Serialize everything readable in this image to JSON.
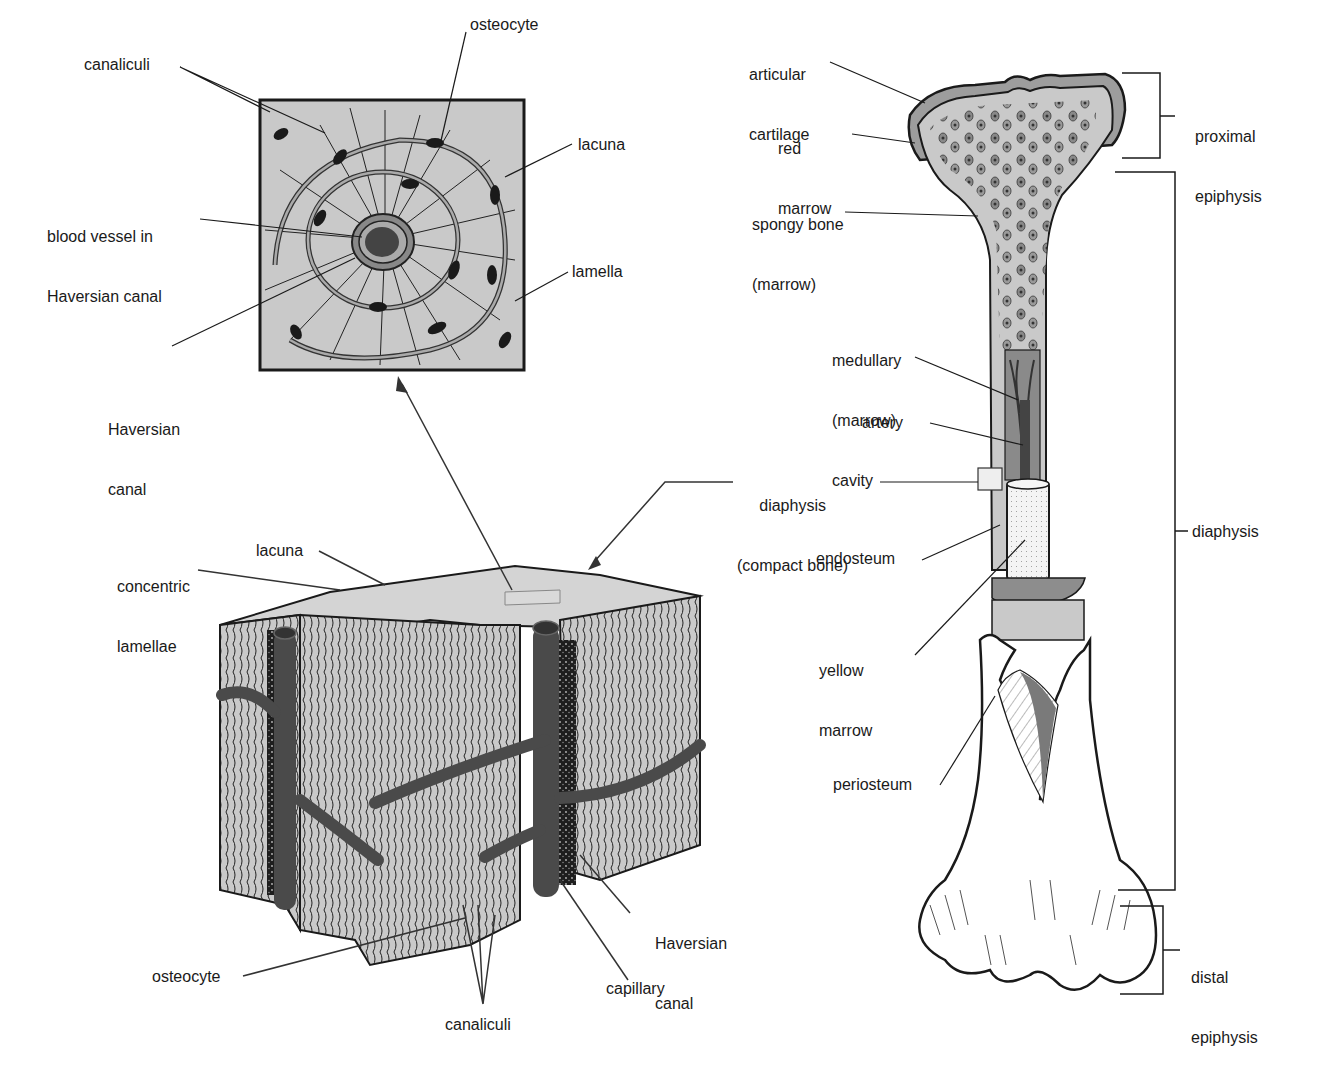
{
  "figure": {
    "colors": {
      "bone_fill": "#c9c9c9",
      "dark_vessel": "#4a4a4a",
      "ink": "#1a1a1a",
      "cartilage": "#9d9d9d",
      "background": "#ffffff"
    },
    "haversian_inset": {
      "labels": {
        "canaliculi": "canaliculi",
        "osteocyte": "osteocyte",
        "lacuna": "lacuna",
        "blood_vessel_1": "blood vessel in",
        "blood_vessel_2": "Haversian canal",
        "lamella": "lamella",
        "haversian_canal_1": "Haversian",
        "haversian_canal_2": "canal"
      }
    },
    "compact_bone_block": {
      "labels": {
        "concentric_1": "concentric",
        "concentric_2": "lamellae",
        "lacuna": "lacuna",
        "osteocyte": "osteocyte",
        "canaliculi": "canaliculi",
        "capillary": "capillary",
        "haversian_canal_1": "Haversian",
        "haversian_canal_2": "canal"
      }
    },
    "long_bone": {
      "labels": {
        "articular_1": "articular",
        "articular_2": "cartilage",
        "red_marrow_1": "red",
        "red_marrow_2": "marrow",
        "spongy_1": "spongy bone",
        "spongy_2": "(marrow)",
        "medullary_1": "medullary",
        "medullary_2": "(marrow)",
        "medullary_3": "cavity",
        "artery": "artery",
        "diaphysis_compact_1": "diaphysis",
        "diaphysis_compact_2": "(compact bone)",
        "endosteum": "endosteum",
        "yellow_marrow_1": "yellow",
        "yellow_marrow_2": "marrow",
        "periosteum": "periosteum"
      },
      "brackets": {
        "proximal_1": "proximal",
        "proximal_2": "epiphysis",
        "diaphysis": "diaphysis",
        "distal_1": "distal",
        "distal_2": "epiphysis"
      }
    }
  }
}
